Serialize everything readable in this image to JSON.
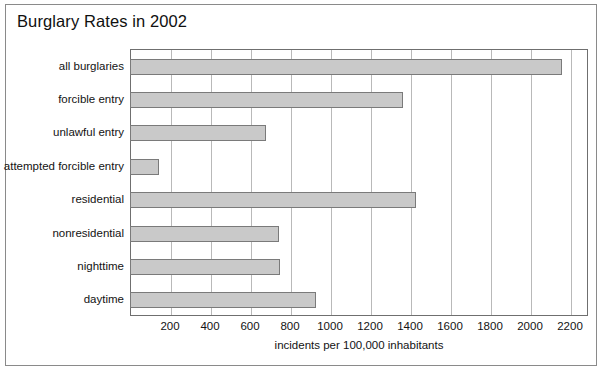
{
  "chart_data": {
    "type": "bar",
    "orientation": "horizontal",
    "title": "Burglary Rates in 2002",
    "xlabel": "incidents per 100,000 inhabitants",
    "ylabel": "",
    "categories": [
      "all burglaries",
      "forcible entry",
      "unlawful entry",
      "attempted forcible entry",
      "residential",
      "nonresidential",
      "nighttime",
      "daytime"
    ],
    "values": [
      2155,
      1360,
      675,
      140,
      1425,
      740,
      745,
      925
    ],
    "xlim": [
      0,
      2290
    ],
    "xticks": [
      200,
      400,
      600,
      800,
      1000,
      1200,
      1400,
      1600,
      1800,
      2000,
      2200
    ],
    "xtick_labels": [
      "200",
      "400",
      "600",
      "800",
      "1000",
      "1200",
      "1400",
      "1600",
      "1800",
      "2000",
      "2200"
    ],
    "grid": "vertical",
    "legend": null,
    "bar_color": "#c9c9c9",
    "bar_edge_color": "#7a7a7a",
    "grid_color": "#b9b9b9",
    "axis_color": "#6f6f6f",
    "text_color": "#131313",
    "background": "#ffffff"
  }
}
